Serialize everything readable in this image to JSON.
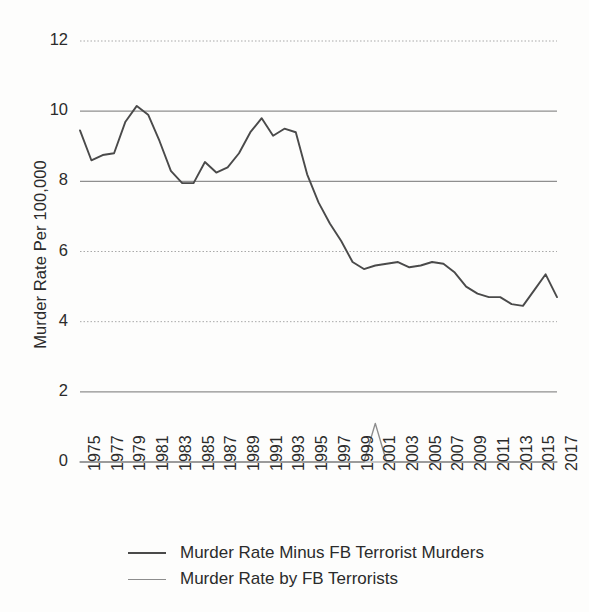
{
  "chart_data": {
    "type": "line",
    "title": "",
    "xlabel": "",
    "ylabel": "Murder Rate Per 100,000",
    "ylim": [
      0,
      12
    ],
    "yticks": [
      0,
      2,
      4,
      6,
      8,
      10,
      12
    ],
    "xlim": [
      1975,
      2017
    ],
    "xticks": [
      1975,
      1977,
      1979,
      1981,
      1983,
      1985,
      1987,
      1989,
      1991,
      1993,
      1995,
      1997,
      1999,
      2001,
      2003,
      2005,
      2007,
      2009,
      2011,
      2013,
      2015,
      2017
    ],
    "xtick_labels": [
      "1975",
      "1977",
      "1979",
      "1981",
      "1983",
      "1985",
      "1987",
      "1989",
      "1991",
      "1993",
      "1995",
      "1997",
      "1999",
      "2001",
      "2003",
      "2005",
      "2007",
      "2009",
      "2011",
      "2013",
      "2015",
      "2017"
    ],
    "grid": true,
    "legend_position": "bottom",
    "x": [
      1975,
      1976,
      1977,
      1978,
      1979,
      1980,
      1981,
      1982,
      1983,
      1984,
      1985,
      1986,
      1987,
      1988,
      1989,
      1990,
      1991,
      1992,
      1993,
      1994,
      1995,
      1996,
      1997,
      1998,
      1999,
      2000,
      2001,
      2002,
      2003,
      2004,
      2005,
      2006,
      2007,
      2008,
      2009,
      2010,
      2011,
      2012,
      2013,
      2014,
      2015,
      2016,
      2017
    ],
    "series": [
      {
        "name": "Murder Rate Minus FB Terrorist Murders",
        "color": "#4a4a4a",
        "values": [
          9.45,
          8.6,
          8.75,
          8.8,
          9.7,
          10.15,
          9.9,
          9.15,
          8.3,
          7.95,
          7.95,
          8.55,
          8.25,
          8.4,
          8.8,
          9.4,
          9.8,
          9.3,
          9.5,
          9.4,
          8.2,
          7.4,
          6.8,
          6.3,
          5.7,
          5.5,
          5.6,
          5.65,
          5.7,
          5.55,
          5.6,
          5.7,
          5.65,
          5.4,
          5.0,
          4.8,
          4.7,
          4.7,
          4.5,
          4.45,
          4.9,
          5.35,
          4.7
        ]
      },
      {
        "name": "Murder Rate by FB Terrorists",
        "color": "#8d8d8d",
        "values": [
          0,
          0,
          0,
          0,
          0,
          0,
          0,
          0,
          0,
          0,
          0,
          0,
          0,
          0,
          0,
          0,
          0,
          0,
          0,
          0,
          0,
          0,
          0,
          0,
          0,
          0,
          1.1,
          0,
          0,
          0,
          0,
          0,
          0,
          0,
          0,
          0,
          0,
          0,
          0,
          0,
          0,
          0,
          0
        ]
      }
    ]
  },
  "legend": {
    "items": [
      {
        "label": "Murder Rate Minus FB Terrorist Murders"
      },
      {
        "label": "Murder Rate by FB Terrorists"
      }
    ]
  }
}
